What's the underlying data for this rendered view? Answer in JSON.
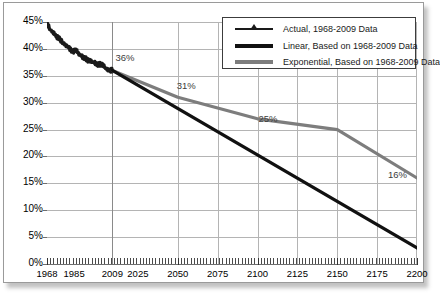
{
  "chart_data": {
    "type": "line",
    "title": "",
    "xlabel": "",
    "ylabel": "",
    "xlim": [
      1968,
      2200
    ],
    "ylim": [
      0,
      45
    ],
    "grid": true,
    "legend_position": "top-right",
    "x_ticks": [
      "1968",
      "1985",
      "2009",
      "2025",
      "2050",
      "2075",
      "2100",
      "2125",
      "2150",
      "2175",
      "2200"
    ],
    "x_tick_values": [
      1968,
      1985,
      2009,
      2025,
      2050,
      2075,
      2100,
      2125,
      2150,
      2175,
      2200
    ],
    "y_ticks": [
      "0%",
      "5%",
      "10%",
      "15%",
      "20%",
      "25%",
      "30%",
      "35%",
      "40%",
      "45%"
    ],
    "y_tick_values": [
      0,
      5,
      10,
      15,
      20,
      25,
      30,
      35,
      40,
      45
    ],
    "series": [
      {
        "name": "Actual, 1968-2009 Data",
        "color": "#1a1a1a",
        "style": "jagged-thick",
        "x": [
          1968,
          1970,
          1972,
          1974,
          1976,
          1978,
          1980,
          1982,
          1984,
          1986,
          1988,
          1990,
          1992,
          1994,
          1996,
          1998,
          2000,
          2002,
          2004,
          2006,
          2008,
          2009
        ],
        "values": [
          44.8,
          43.6,
          43.0,
          42.3,
          41.8,
          41.2,
          40.6,
          40.2,
          39.4,
          40.0,
          39.0,
          38.6,
          38.2,
          37.9,
          37.6,
          37.4,
          37.0,
          37.2,
          36.6,
          36.1,
          36.0,
          36.0
        ]
      },
      {
        "name": "Linear, Based on 1968-2009 Data",
        "color": "#111111",
        "style": "solid-thick",
        "x": [
          2009,
          2200
        ],
        "values": [
          36,
          3
        ]
      },
      {
        "name": "Exponential, Based on 1968-2009 Data",
        "color": "#7d7d7d",
        "style": "solid-thick",
        "x": [
          2009,
          2050,
          2100,
          2150,
          2200
        ],
        "values": [
          36,
          31,
          27,
          25,
          16
        ]
      }
    ],
    "annotations": [
      {
        "label": "36%",
        "x": 2009,
        "y": 36
      },
      {
        "label": "31%",
        "x": 2050,
        "y": 31
      },
      {
        "label": "25%",
        "x": 2100,
        "y": 25
      },
      {
        "label": "16%",
        "x": 2200,
        "y": 16
      }
    ]
  },
  "legend": {
    "items": [
      {
        "label": "Actual, 1968-2009 Data"
      },
      {
        "label": "Linear, Based on 1968-2009 Data"
      },
      {
        "label": "Exponential, Based on 1968-2009 Data"
      }
    ]
  }
}
